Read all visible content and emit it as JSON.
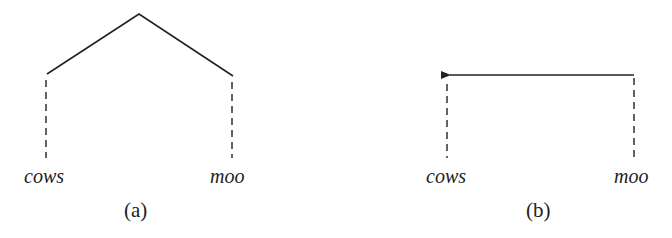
{
  "panels": [
    {
      "id": "a",
      "caption": "(a)",
      "type": "tree",
      "leaves": [
        {
          "word": "cows"
        },
        {
          "word": "moo"
        }
      ]
    },
    {
      "id": "b",
      "caption": "(b)",
      "type": "dependency-arrow",
      "arrow": {
        "from": "moo",
        "to": "cows"
      },
      "leaves": [
        {
          "word": "cows"
        },
        {
          "word": "moo"
        }
      ]
    }
  ],
  "colors": {
    "line": "#222222",
    "background": "#ffffff"
  }
}
